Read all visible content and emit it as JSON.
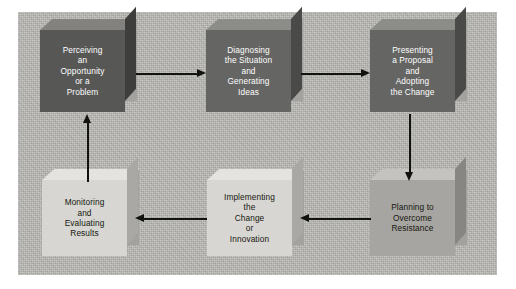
{
  "diagram": {
    "panel_color": "#b9b8b4",
    "nodes": [
      {
        "id": "perceiving",
        "label": "Perceiving\nan\nOpportunity\nor a\nProblem",
        "tone": "darkest",
        "row": "top",
        "column": 1
      },
      {
        "id": "diagnosing",
        "label": "Diagnosing\nthe Situation\nand\nGenerating\nIdeas",
        "tone": "dark",
        "row": "top",
        "column": 2
      },
      {
        "id": "presenting",
        "label": "Presenting\na Proposal\nand\nAdopting\nthe Change",
        "tone": "dark",
        "row": "top",
        "column": 3
      },
      {
        "id": "planning",
        "label": "Planning to\nOvercome\nResistance",
        "tone": "mid",
        "row": "bottom",
        "column": 3
      },
      {
        "id": "implementing",
        "label": "Implementing\nthe\nChange\nor\nInnovation",
        "tone": "light",
        "row": "bottom",
        "column": 2
      },
      {
        "id": "monitoring",
        "label": "Monitoring\nand\nEvaluating\nResults",
        "tone": "light",
        "row": "bottom",
        "column": 1
      }
    ],
    "connections": [
      {
        "from": "perceiving",
        "to": "diagnosing",
        "direction": "right"
      },
      {
        "from": "diagnosing",
        "to": "presenting",
        "direction": "right"
      },
      {
        "from": "presenting",
        "to": "planning",
        "direction": "down"
      },
      {
        "from": "planning",
        "to": "implementing",
        "direction": "left"
      },
      {
        "from": "implementing",
        "to": "monitoring",
        "direction": "left"
      },
      {
        "from": "monitoring",
        "to": "perceiving",
        "direction": "up"
      }
    ]
  }
}
